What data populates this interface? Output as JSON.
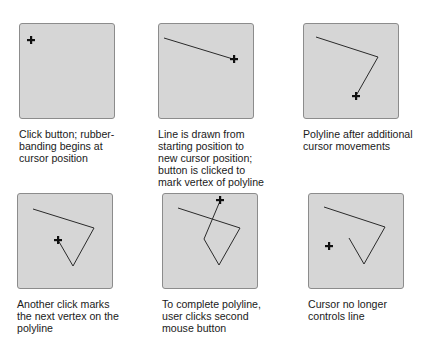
{
  "colors": {
    "panel_fill": "#d6d6d6",
    "panel_border": "#8c8c8c",
    "line": "#2a2a2a",
    "cursor": "#111111",
    "caption_text": "#1a1a1a"
  },
  "panels": [
    {
      "id": "step-1",
      "caption_lines": [
        "Click button; rubber-",
        "banding begins at",
        "cursor position"
      ],
      "polyline": [],
      "cursor": [
        12,
        17
      ],
      "cursor_icon": "crosshair-plus-icon"
    },
    {
      "id": "step-2",
      "caption_lines": [
        "Line is drawn from",
        "starting position to",
        "new cursor position;",
        "button is clicked to",
        "mark vertex of polyline"
      ],
      "polyline": [
        [
          6,
          15
        ],
        [
          75,
          36
        ]
      ],
      "cursor": [
        76,
        36
      ],
      "cursor_icon": "crosshair-plus-icon"
    },
    {
      "id": "step-3",
      "caption_lines": [
        "Polyline after additional",
        "cursor movements"
      ],
      "polyline": [
        [
          13,
          14
        ],
        [
          75,
          34
        ],
        [
          54,
          71
        ]
      ],
      "cursor": [
        53,
        73
      ],
      "cursor_icon": "crosshair-plus-icon"
    },
    {
      "id": "step-4",
      "caption_lines": [
        "Another click marks",
        "the next vertex on the",
        "polyline"
      ],
      "polyline": [
        [
          16,
          16
        ],
        [
          77,
          35
        ],
        [
          56,
          73
        ],
        [
          41,
          47
        ]
      ],
      "cursor": [
        41,
        47
      ],
      "cursor_icon": "crosshair-plus-icon"
    },
    {
      "id": "step-5",
      "caption_lines": [
        "To complete polyline,",
        "user clicks second",
        "mouse button"
      ],
      "polyline": [
        [
          16,
          15
        ],
        [
          78,
          35
        ],
        [
          57,
          72
        ],
        [
          42,
          46
        ],
        [
          58,
          8
        ]
      ],
      "cursor": [
        58,
        7
      ],
      "cursor_icon": "crosshair-plus-icon"
    },
    {
      "id": "step-6",
      "caption_lines": [
        "Cursor no longer",
        "controls line"
      ],
      "polyline": [
        [
          16,
          14
        ],
        [
          77,
          34
        ],
        [
          56,
          71
        ],
        [
          41,
          45
        ]
      ],
      "cursor": [
        21,
        53
      ],
      "cursor_icon": "crosshair-plus-icon"
    }
  ]
}
